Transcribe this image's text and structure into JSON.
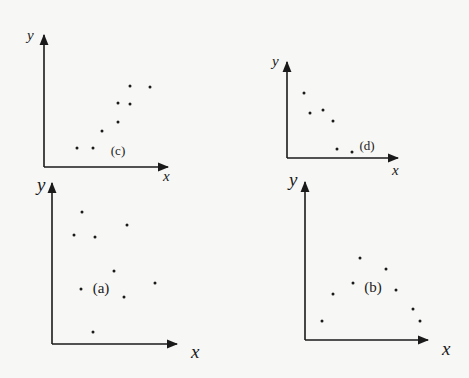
{
  "chart_data": [
    {
      "type": "scatter",
      "panel_label": "(c)",
      "xlabel": "x",
      "ylabel": "y",
      "grid": false,
      "trend": "positive correlation",
      "geometry": {
        "origin": [
          44,
          167
        ],
        "x_end": 168,
        "y_top": 35,
        "label_pos": [
          118,
          155
        ],
        "label_size": 13,
        "axis_label_size": 15,
        "xlabel_pos": [
          163,
          181
        ],
        "ylabel_pos": [
          27,
          40
        ]
      },
      "points_px": [
        [
          77,
          148
        ],
        [
          93,
          148
        ],
        [
          102,
          131
        ],
        [
          118,
          122
        ],
        [
          118,
          103
        ],
        [
          130,
          104
        ],
        [
          130,
          86
        ],
        [
          150,
          87
        ]
      ],
      "points": [
        {
          "x": 0.27,
          "y": 0.14
        },
        {
          "x": 0.4,
          "y": 0.14
        },
        {
          "x": 0.47,
          "y": 0.27
        },
        {
          "x": 0.6,
          "y": 0.34
        },
        {
          "x": 0.6,
          "y": 0.48
        },
        {
          "x": 0.69,
          "y": 0.48
        },
        {
          "x": 0.69,
          "y": 0.61
        },
        {
          "x": 0.85,
          "y": 0.61
        }
      ]
    },
    {
      "type": "scatter",
      "panel_label": "(d)",
      "xlabel": "x",
      "ylabel": "y",
      "grid": false,
      "trend": "negative correlation",
      "geometry": {
        "origin": [
          287,
          158
        ],
        "x_end": 398,
        "y_top": 62,
        "label_pos": [
          367,
          150
        ],
        "label_size": 13,
        "axis_label_size": 15,
        "xlabel_pos": [
          392,
          175
        ],
        "ylabel_pos": [
          272,
          66
        ]
      },
      "points_px": [
        [
          304,
          93
        ],
        [
          310,
          113
        ],
        [
          323,
          110
        ],
        [
          333,
          121
        ],
        [
          337,
          149
        ],
        [
          352,
          152
        ]
      ],
      "points": [
        {
          "x": 0.15,
          "y": 0.68
        },
        {
          "x": 0.21,
          "y": 0.47
        },
        {
          "x": 0.32,
          "y": 0.5
        },
        {
          "x": 0.41,
          "y": 0.39
        },
        {
          "x": 0.45,
          "y": 0.09
        },
        {
          "x": 0.59,
          "y": 0.06
        }
      ]
    },
    {
      "type": "scatter",
      "panel_label": "(a)",
      "xlabel": "x",
      "ylabel": "y",
      "grid": false,
      "trend": "no correlation",
      "geometry": {
        "origin": [
          52,
          344
        ],
        "x_end": 177,
        "y_top": 183,
        "label_pos": [
          101,
          293
        ],
        "label_size": 15,
        "axis_label_size": 19,
        "xlabel_pos": [
          191,
          358
        ],
        "ylabel_pos": [
          37,
          191
        ]
      },
      "points_px": [
        [
          82,
          212
        ],
        [
          74,
          235
        ],
        [
          95,
          237
        ],
        [
          127,
          225
        ],
        [
          114,
          271
        ],
        [
          81,
          289
        ],
        [
          124,
          297
        ],
        [
          155,
          283
        ],
        [
          93,
          332
        ]
      ],
      "points": [
        {
          "x": 0.24,
          "y": 0.82
        },
        {
          "x": 0.18,
          "y": 0.68
        },
        {
          "x": 0.34,
          "y": 0.66
        },
        {
          "x": 0.6,
          "y": 0.74
        },
        {
          "x": 0.5,
          "y": 0.45
        },
        {
          "x": 0.23,
          "y": 0.34
        },
        {
          "x": 0.58,
          "y": 0.29
        },
        {
          "x": 0.82,
          "y": 0.38
        },
        {
          "x": 0.33,
          "y": 0.07
        }
      ]
    },
    {
      "type": "scatter",
      "panel_label": "(b)",
      "xlabel": "x",
      "ylabel": "y",
      "grid": false,
      "trend": "nonlinear (inverted U)",
      "geometry": {
        "origin": [
          305,
          340
        ],
        "x_end": 428,
        "y_top": 182,
        "label_pos": [
          373,
          292
        ],
        "label_size": 15,
        "axis_label_size": 19,
        "xlabel_pos": [
          442,
          355
        ],
        "ylabel_pos": [
          289,
          186
        ]
      },
      "points_px": [
        [
          360,
          258
        ],
        [
          386,
          269
        ],
        [
          353,
          283
        ],
        [
          396,
          290
        ],
        [
          333,
          294
        ],
        [
          413,
          309
        ],
        [
          322,
          321
        ],
        [
          420,
          321
        ]
      ],
      "points": [
        {
          "x": 0.45,
          "y": 0.52
        },
        {
          "x": 0.66,
          "y": 0.45
        },
        {
          "x": 0.39,
          "y": 0.36
        },
        {
          "x": 0.74,
          "y": 0.32
        },
        {
          "x": 0.23,
          "y": 0.29
        },
        {
          "x": 0.88,
          "y": 0.2
        },
        {
          "x": 0.14,
          "y": 0.12
        },
        {
          "x": 0.94,
          "y": 0.12
        }
      ]
    }
  ],
  "colors": {
    "background": "#f7f7f5",
    "ink": "#1a1a1a"
  }
}
